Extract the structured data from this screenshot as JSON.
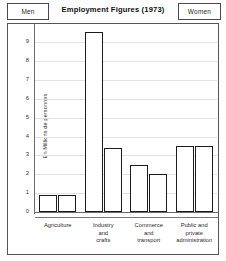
{
  "legend": {
    "left_label": "Men",
    "right_label": "Women"
  },
  "chart_data": {
    "type": "bar",
    "title": "Employment Figures  (1973)",
    "xlabel": "",
    "ylabel": "En Millions de personnes",
    "ylim": [
      0,
      9.6
    ],
    "yticks": [
      "0",
      "1",
      "2",
      "3",
      "4",
      "5",
      "6",
      "7",
      "8",
      "9"
    ],
    "ytick_values": [
      0,
      1,
      2,
      3,
      4,
      5,
      6,
      7,
      8,
      9
    ],
    "grid": true,
    "legend_position": "top",
    "categories": [
      "Agriculture",
      "Industry and crafts",
      "Commerce and transport",
      "Public and private administration"
    ],
    "category_lines": [
      [
        "Agriculture"
      ],
      [
        "Industry",
        "and",
        "crafts"
      ],
      [
        "Commerce",
        "and",
        "transport"
      ],
      [
        "Public and",
        "private",
        "administration"
      ]
    ],
    "series": [
      {
        "name": "Men",
        "values": [
          0.9,
          9.55,
          2.5,
          3.5
        ]
      },
      {
        "name": "Women",
        "values": [
          0.9,
          3.4,
          2.0,
          3.5
        ]
      }
    ]
  },
  "colors": {
    "bar_fill": "#ffffff",
    "bar_stroke": "#1c1c1c",
    "grid": "#e3e3e3",
    "axis": "#6a6a6a",
    "frame": "#555555",
    "text": "#1a1a1a"
  }
}
